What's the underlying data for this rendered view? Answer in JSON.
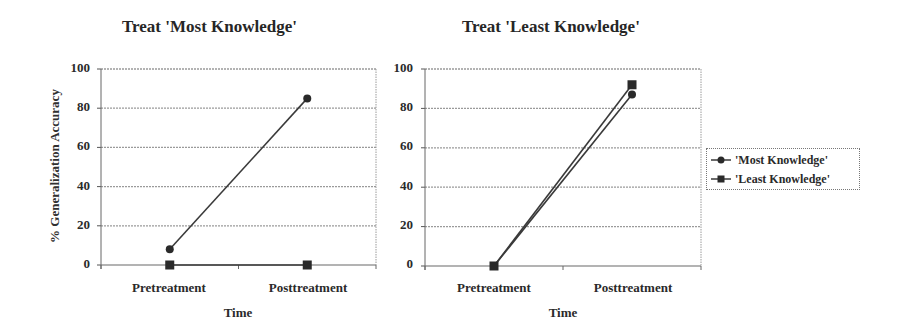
{
  "chart_data": [
    {
      "type": "line",
      "title": "Treat 'Most Knowledge'",
      "xlabel": "Time",
      "ylabel": "% Generalization Accuracy",
      "categories": [
        "Pretreatment",
        "Posttreatment"
      ],
      "ylim": [
        0,
        100
      ],
      "yticks": [
        0,
        20,
        40,
        60,
        80,
        100
      ],
      "grid": true,
      "series": [
        {
          "name": "'Most Knowledge'",
          "marker": "circle",
          "values": [
            8,
            85
          ]
        },
        {
          "name": "'Least Knowledge'",
          "marker": "square",
          "values": [
            0,
            0
          ]
        }
      ]
    },
    {
      "type": "line",
      "title": "Treat 'Least Knowledge'",
      "xlabel": "Time",
      "ylabel": "",
      "categories": [
        "Pretreatment",
        "Posttreatment"
      ],
      "ylim": [
        0,
        100
      ],
      "yticks": [
        0,
        20,
        40,
        60,
        80,
        100
      ],
      "grid": true,
      "legend_position": "right",
      "series": [
        {
          "name": "'Most Knowledge'",
          "marker": "circle",
          "values": [
            0,
            87
          ]
        },
        {
          "name": "'Least Knowledge'",
          "marker": "square",
          "values": [
            0,
            92
          ]
        }
      ]
    }
  ],
  "charts": {
    "left": {
      "title": "Treat 'Most Knowledge'",
      "ylabel": "% Generalization Accuracy",
      "xlabel": "Time",
      "cat0": "Pretreatment",
      "cat1": "Posttreatment",
      "ticks": [
        "100",
        "80",
        "60",
        "40",
        "20",
        "0"
      ]
    },
    "right": {
      "title": "Treat 'Least Knowledge'",
      "xlabel": "Time",
      "cat0": "Pretreatment",
      "cat1": "Posttreatment",
      "ticks": [
        "100",
        "80",
        "60",
        "40",
        "20",
        "0"
      ]
    }
  },
  "legend": {
    "items": [
      {
        "label": "'Most Knowledge'",
        "icon": "circle-marker-icon"
      },
      {
        "label": "'Least Knowledge'",
        "icon": "square-marker-icon"
      }
    ]
  },
  "colors": {
    "line": "#3a3a3a",
    "grid": "#9a9a9a",
    "text": "#2a2a2a"
  }
}
